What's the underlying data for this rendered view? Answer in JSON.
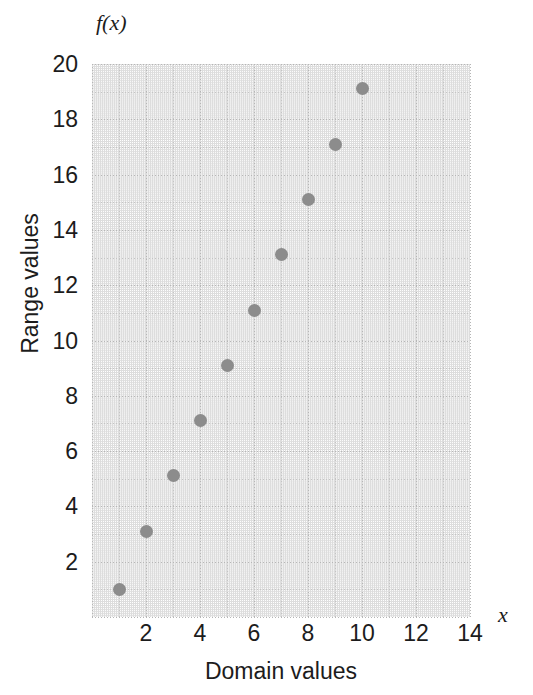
{
  "chart_data": {
    "type": "scatter",
    "title": "",
    "xlabel": "Domain values",
    "ylabel": "Range values",
    "x_axis_symbol": "x",
    "y_axis_symbol": "f(x)",
    "xlim": [
      0,
      14
    ],
    "ylim": [
      0,
      20
    ],
    "x_ticks": [
      2,
      4,
      6,
      8,
      10,
      12,
      14
    ],
    "y_ticks": [
      2,
      4,
      6,
      8,
      10,
      12,
      14,
      16,
      18,
      20
    ],
    "x_tick_labels": [
      "2",
      "4",
      "6",
      "8",
      "10",
      "12",
      "14"
    ],
    "y_tick_labels": [
      "2",
      "4",
      "6",
      "8",
      "10",
      "12",
      "14",
      "16",
      "18",
      "20"
    ],
    "grid": true,
    "grid_style": "dotted",
    "legend": false,
    "marker_color": "#8c8c8c",
    "marker_shape": "circle",
    "marker_size": 13,
    "points": [
      {
        "x": 1,
        "y": 1.0
      },
      {
        "x": 2,
        "y": 3.1
      },
      {
        "x": 3,
        "y": 5.1
      },
      {
        "x": 4,
        "y": 7.1
      },
      {
        "x": 5,
        "y": 9.1
      },
      {
        "x": 6,
        "y": 11.1
      },
      {
        "x": 7,
        "y": 13.1
      },
      {
        "x": 8,
        "y": 15.1
      },
      {
        "x": 9,
        "y": 17.1
      },
      {
        "x": 10,
        "y": 19.1
      }
    ]
  },
  "colors": {
    "marker": "#8c8c8c",
    "grid_minor": "#d8d8d8",
    "grid_major": "#b6b6b6",
    "text": "#1c1c1c",
    "background": "#ffffff"
  }
}
